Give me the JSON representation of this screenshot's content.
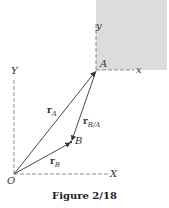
{
  "figure": {
    "caption": "Figure 2/18",
    "colors": {
      "shaded_body": "#dcdcdc",
      "lines": "#333333",
      "dashed_axes": "#777777"
    }
  },
  "labels": {
    "origin": "O",
    "fixed_x_axis": "X",
    "fixed_y_axis": "Y",
    "moving_x_axis": "x",
    "moving_y_axis": "y",
    "point_a": "A",
    "point_b": "B"
  },
  "vectors": {
    "r_a": {
      "base": "r",
      "sub": "A"
    },
    "r_b": {
      "base": "r",
      "sub": "B"
    },
    "r_b_a": {
      "base": "r",
      "sub": "B/A"
    }
  }
}
